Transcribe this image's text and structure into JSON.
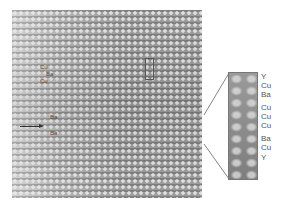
{
  "figure": {
    "type": "HRTEM lattice micrograph with magnified inset",
    "micrograph_labels": [
      "Cu",
      "Ba",
      "Cu"
    ],
    "arrow_labels": [
      "Ba",
      "Ba"
    ],
    "inset_element_labels": [
      "Y",
      "Cu",
      "Ba",
      "Cu",
      "Cu",
      "Cu",
      "Ba",
      "Cu",
      "Y"
    ],
    "colors": {
      "background": "#ffffff",
      "micrograph_gray": "#9a9a9a",
      "label_gray": "#555555",
      "arrow": "#333333"
    }
  }
}
